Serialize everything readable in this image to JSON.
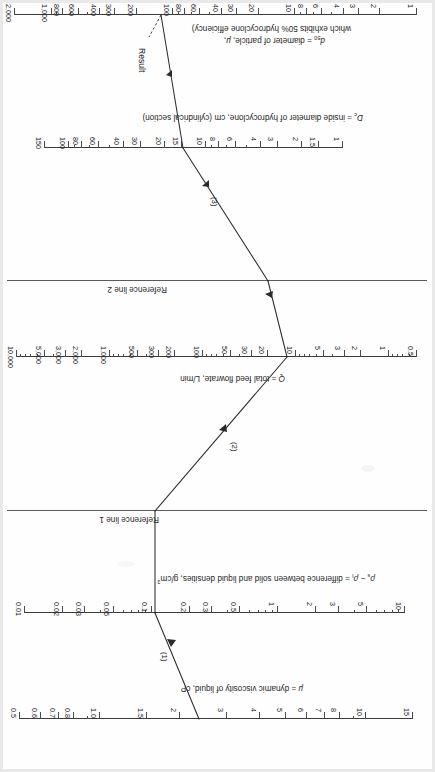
{
  "figure": {
    "kind": "nomograph",
    "orientation_note": "rotated-180",
    "result_label": "Result"
  },
  "reference_lines": [
    {
      "id": "ref1",
      "label": "Reference line 1"
    },
    {
      "id": "ref2",
      "label": "Reference line 2"
    }
  ],
  "step_labels": [
    {
      "id": "step1",
      "label": "(1)"
    },
    {
      "id": "step2",
      "label": "(2)"
    },
    {
      "id": "step3",
      "label": "(3)"
    }
  ],
  "chart_data": {
    "type": "line",
    "subtitle": "",
    "xlabel": "",
    "ylabel": "",
    "grid": false,
    "legend": "none",
    "axes": [
      {
        "id": "mu",
        "name": "mu-scale",
        "title_html": "μ = dynamic viscosity of liquid, cP",
        "title_plain": "μ = dynamic viscosity of liquid, cP",
        "units": "cP",
        "scale": "log",
        "range": [
          15,
          0.5
        ],
        "direction": "descending",
        "ticks": [
          "15",
          "10",
          "8",
          "7",
          "6",
          "5",
          "4",
          "3",
          "2",
          "1.5",
          "1.0",
          "0.8",
          "0.7",
          "0.6",
          "0.5"
        ],
        "tick_values": [
          15,
          10,
          8,
          7,
          6,
          5,
          4,
          3,
          2,
          1.5,
          1.0,
          0.8,
          0.7,
          0.6,
          0.5
        ],
        "reading": 2
      },
      {
        "id": "rho",
        "name": "density-difference-scale",
        "title_html": "ρ<sub>s</sub> − ρ<sub>l</sub> = difference between solid and liquid densities, g/cm³",
        "title_plain": "ρs - ρl = difference between solid and liquid densities, g/cm3",
        "units": "g/cm3",
        "scale": "log",
        "range": [
          10,
          0.01
        ],
        "direction": "descending",
        "ticks": [
          "10",
          "5",
          "3",
          "2",
          "1",
          "0.5",
          "0.3",
          "0.2",
          "0.1",
          "0.05",
          "0.03",
          "0.02",
          "0.01"
        ],
        "tick_values": [
          10,
          5,
          3,
          2,
          1,
          0.5,
          0.3,
          0.2,
          0.1,
          0.05,
          0.03,
          0.02,
          0.01
        ],
        "reading": 1.6
      },
      {
        "id": "Q",
        "name": "flowrate-scale",
        "title_html": "<i>Q</i> = total feed flowrate, L/min",
        "title_plain": "Q = total feed flowrate, L/min",
        "units": "L/min",
        "scale": "log",
        "range": [
          0.5,
          10000
        ],
        "direction": "ascending",
        "ticks": [
          "0.5",
          "1",
          "2",
          "3",
          "5",
          "10",
          "20",
          "30",
          "50",
          "100",
          "200",
          "300",
          "500",
          "1,000",
          "2,000",
          "3,000",
          "5,000",
          "10,000"
        ],
        "tick_values": [
          0.5,
          1,
          2,
          3,
          5,
          10,
          20,
          30,
          50,
          100,
          200,
          300,
          500,
          1000,
          2000,
          3000,
          5000,
          10000
        ],
        "reading": 100
      },
      {
        "id": "Dc",
        "name": "hydrocyclone-diameter-scale",
        "title_html": "<i>D</i><sub>c</sub> = inside diameter of hydrocyclone, cm (cylindrical section)",
        "title_plain": "Dc = inside diameter of hydrocyclone, cm (cylindrical section)",
        "units": "cm",
        "scale": "log",
        "range": [
          1,
          150
        ],
        "direction": "ascending",
        "ticks": [
          "1",
          "1.5",
          "2",
          "3",
          "4",
          "6",
          "8",
          "10",
          "15",
          "20",
          "30",
          "40",
          "60",
          "80",
          "100",
          "150"
        ],
        "tick_values": [
          1,
          1.5,
          2,
          3,
          4,
          6,
          8,
          10,
          15,
          20,
          30,
          40,
          60,
          80,
          100,
          150
        ],
        "reading": 10
      },
      {
        "id": "d50",
        "name": "particle-diameter-scale",
        "title_html": "<i>d</i><sub>50</sub> = diameter of particle, μ, (which exhibits 50% hydrocyclone efficiency)",
        "title_line1": "d50 = diameter of particle, μ,",
        "title_line2": "which exhibits 50% hydrocyclone efficiency)",
        "units": "micron",
        "scale": "log",
        "range": [
          1,
          2000
        ],
        "direction": "ascending",
        "ticks": [
          "1",
          "2",
          "3",
          "4",
          "6",
          "8",
          "10",
          "20",
          "30",
          "40",
          "60",
          "80",
          "100",
          "200",
          "300",
          "400",
          "600",
          "800",
          "1,000",
          "2,000"
        ],
        "tick_values": [
          1,
          2,
          3,
          4,
          6,
          8,
          10,
          20,
          30,
          40,
          60,
          80,
          100,
          200,
          300,
          400,
          600,
          800,
          1000,
          2000
        ],
        "reading": 14
      }
    ],
    "construction": {
      "note": "Three-segment construction path connecting scale readings through two reference lines",
      "segments": [
        {
          "id": "seg1",
          "label": "(1)",
          "from_axis": "mu",
          "from_value": 2,
          "to_axis": "rho",
          "to_value": 1.6
        },
        {
          "id": "seg2",
          "label": "(2)",
          "from_axis": "ref1",
          "to_axis": "Q",
          "to_value": 100
        },
        {
          "id": "seg3",
          "label": "(3)",
          "from_axis": "ref2",
          "to_axis": "Dc",
          "to_value": 10
        },
        {
          "id": "seg4",
          "label": "Result",
          "from_axis": "Dc",
          "to_axis": "d50",
          "to_value": 14
        }
      ]
    }
  },
  "colors": {
    "ink": "#1a1a1a",
    "rule": "#3a3a3a",
    "reference_rule": "#5a5a5a",
    "paper": "#fefefe",
    "page_edge": "#e9e9e9"
  }
}
